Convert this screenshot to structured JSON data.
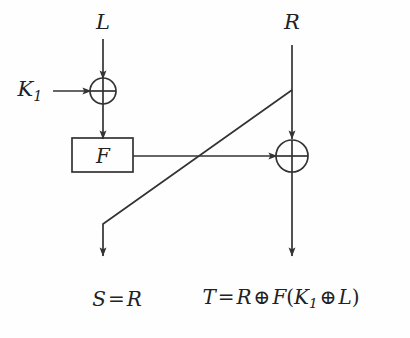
{
  "figure": {
    "background_color": "#fefefe",
    "stroke_color": "#333333"
  },
  "labels": {
    "input_left": "L",
    "input_right": "R",
    "key": "K",
    "key_subscript": "1",
    "function_box": "F",
    "xor_symbol": "⊕"
  },
  "outputs": {
    "left": {
      "name": "S",
      "equals": "=",
      "expr": "R",
      "full": "S = R"
    },
    "right": {
      "name": "T",
      "equals": "=",
      "operand1": "R",
      "xor1": "⊕",
      "func": "F",
      "open": "(",
      "key": "K",
      "key_sub": "1",
      "xor2": "⊕",
      "operand2": "L",
      "close": ")",
      "full": "T = R ⊕ F(K₁ ⊕ L)"
    }
  },
  "nodes": {
    "xor_left": {
      "cx": 103,
      "cy": 91,
      "r": 13,
      "name": "xor-gate-left"
    },
    "xor_right": {
      "cx": 292,
      "cy": 156,
      "r": 16,
      "name": "xor-gate-right"
    },
    "f_box": {
      "x": 72,
      "y": 138,
      "w": 61,
      "h": 34,
      "name": "function-box"
    }
  },
  "edges": [
    {
      "name": "edge-L-to-xor-left",
      "from": "L",
      "to": "xor-gate-left"
    },
    {
      "name": "edge-K1-to-xor-left",
      "from": "K1",
      "to": "xor-gate-left"
    },
    {
      "name": "edge-xor-left-to-F",
      "from": "xor-gate-left",
      "to": "function-box"
    },
    {
      "name": "edge-F-to-xor-right",
      "from": "function-box",
      "to": "xor-gate-right"
    },
    {
      "name": "edge-R-to-xor-right",
      "from": "R",
      "to": "xor-gate-right"
    },
    {
      "name": "edge-R-crossover-to-S",
      "from": "R",
      "to": "S"
    },
    {
      "name": "edge-xor-right-to-T",
      "from": "xor-gate-right",
      "to": "T"
    }
  ]
}
